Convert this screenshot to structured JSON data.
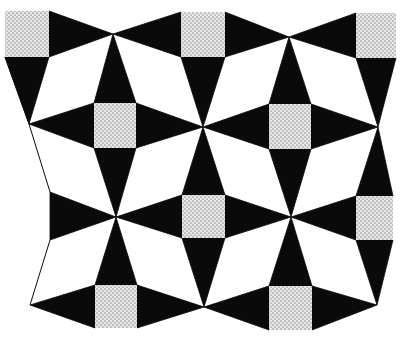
{
  "figure": {
    "colors": {
      "background": "#ffffff",
      "black": "#0a0a0a",
      "stipple_bg": "#e8e8e8",
      "stipple_dot": "#2a2a2a",
      "white_tile": "#ffffff"
    }
  },
  "squares": [
    {
      "x": 5,
      "y": 11,
      "w": 44,
      "h": 46
    },
    {
      "x": 181,
      "y": 12,
      "w": 44,
      "h": 45
    },
    {
      "x": 356,
      "y": 13,
      "w": 40,
      "h": 45
    },
    {
      "x": 94,
      "y": 103,
      "w": 42,
      "h": 45
    },
    {
      "x": 269,
      "y": 104,
      "w": 42,
      "h": 45
    },
    {
      "x": 182,
      "y": 195,
      "w": 43,
      "h": 43
    },
    {
      "x": 356,
      "y": 196,
      "w": 37,
      "h": 44
    },
    {
      "x": 95,
      "y": 285,
      "w": 42,
      "h": 43
    },
    {
      "x": 269,
      "y": 286,
      "w": 43,
      "h": 44
    }
  ],
  "black_triangles": [
    "49,11 113,34 49,57",
    "181,12 113,34 181,57",
    "225,12 289,37 225,57",
    "356,13 289,37 356,58",
    "5,57 49,57 29,124",
    "181,57 225,57 203,127",
    "356,58 396,58 378,127",
    "94,103 136,103 113,34",
    "269,104 311,104 289,37",
    "94,103 29,124 94,148",
    "136,103 203,127 136,148",
    "269,104 203,127 269,149",
    "311,104 378,127 311,149",
    "94,148 136,148 116,217",
    "269,149 311,149 291,217",
    "182,195 225,195 203,127",
    "356,196 393,196 378,127",
    "182,195 116,217 182,238",
    "225,195 291,217 225,238",
    "356,196 291,217 356,240",
    "50,192 116,217 50,240",
    "182,238 225,238 204,307",
    "356,240 393,240 377,305",
    "95,285 137,285 116,217",
    "269,286 312,286 291,217",
    "95,285 30,305 95,328",
    "137,285 204,307 137,328",
    "269,286 204,307 269,330",
    "312,286 377,305 312,330"
  ],
  "outline_edges": [
    "5,57 29,124 50,192",
    "50,240 30,305"
  ]
}
